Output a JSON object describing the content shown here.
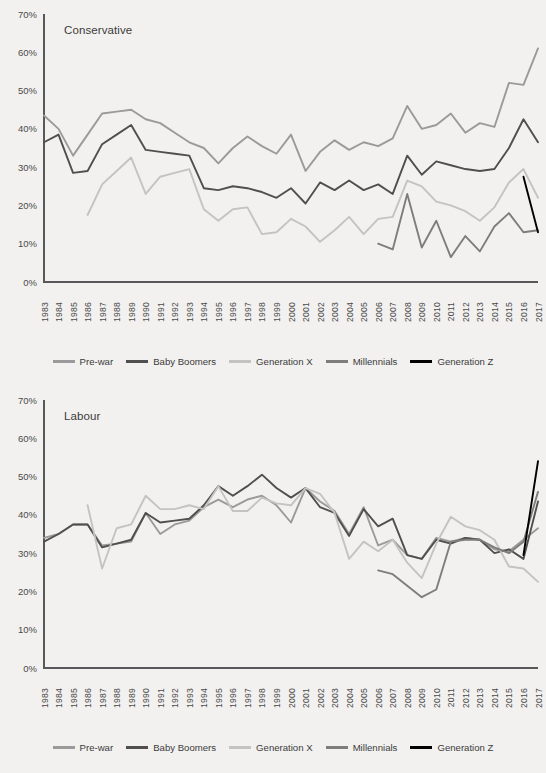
{
  "background_color": "#f2f1ef",
  "axis_color": "#58585a",
  "legend": {
    "items": [
      {
        "label": "Pre-war",
        "color": "#9a9a9a"
      },
      {
        "label": "Baby Boomers",
        "color": "#4f4f4f"
      },
      {
        "label": "Generation X",
        "color": "#c3c3c3"
      },
      {
        "label": "Millennials",
        "color": "#7d7d7d"
      },
      {
        "label": "Generation Z",
        "color": "#000000"
      }
    ]
  },
  "y_axis": {
    "ticks": [
      "0%",
      "10%",
      "20%",
      "30%",
      "40%",
      "50%",
      "60%",
      "70%"
    ],
    "min": 0,
    "max": 70
  },
  "x_axis": {
    "categories": [
      "1983",
      "1984",
      "1985",
      "1986",
      "1987",
      "1988",
      "1989",
      "1990",
      "1991",
      "1992",
      "1993",
      "1994",
      "1995",
      "1996",
      "1997",
      "1998",
      "1999",
      "2000",
      "2001",
      "2002",
      "2003",
      "2004",
      "2005",
      "2006",
      "2007",
      "2008",
      "2009",
      "2010",
      "2011",
      "2012",
      "2013",
      "2014",
      "2015",
      "2016",
      "2017"
    ]
  },
  "chart_data": [
    {
      "type": "line",
      "title": "Conservative",
      "xlabel": "",
      "ylabel": "",
      "ylim": [
        0,
        70
      ],
      "grid": false,
      "legend_position": "bottom",
      "x": [
        "1983",
        "1984",
        "1985",
        "1986",
        "1987",
        "1988",
        "1989",
        "1990",
        "1991",
        "1992",
        "1993",
        "1994",
        "1995",
        "1996",
        "1997",
        "1998",
        "1999",
        "2000",
        "2001",
        "2002",
        "2003",
        "2004",
        "2005",
        "2006",
        "2007",
        "2008",
        "2009",
        "2010",
        "2011",
        "2012",
        "2013",
        "2014",
        "2015",
        "2016",
        "2017"
      ],
      "series": [
        {
          "name": "Pre-war",
          "color": "#9a9a9a",
          "values": [
            43.5,
            40.0,
            33.0,
            38.5,
            44.0,
            44.5,
            45.0,
            42.5,
            41.5,
            39.0,
            36.5,
            35.0,
            31.0,
            35.0,
            38.0,
            35.5,
            33.5,
            38.5,
            29.0,
            34.0,
            37.0,
            34.5,
            36.5,
            35.5,
            37.5,
            46.0,
            40.0,
            41.0,
            44.0,
            39.0,
            41.5,
            40.5,
            52.0,
            51.5,
            61.0
          ]
        },
        {
          "name": "Baby Boomers",
          "color": "#4f4f4f",
          "values": [
            36.5,
            38.5,
            28.5,
            29.0,
            36.0,
            38.5,
            41.0,
            34.5,
            34.0,
            33.5,
            33.0,
            24.5,
            24.0,
            25.0,
            24.5,
            23.5,
            22.0,
            24.5,
            20.5,
            26.0,
            24.0,
            26.5,
            24.0,
            25.5,
            23.0,
            33.0,
            28.0,
            31.5,
            30.5,
            29.5,
            29.0,
            29.5,
            35.0,
            42.5,
            36.5
          ]
        },
        {
          "name": "Generation X",
          "color": "#c3c3c3",
          "values": [
            null,
            null,
            null,
            17.5,
            25.5,
            29.0,
            32.5,
            23.0,
            27.5,
            28.5,
            29.5,
            19.0,
            16.0,
            19.0,
            19.5,
            12.5,
            13.0,
            16.5,
            14.5,
            10.5,
            13.5,
            17.0,
            12.5,
            16.5,
            17.0,
            26.5,
            25.0,
            21.0,
            20.0,
            18.5,
            16.0,
            19.5,
            26.0,
            29.5,
            22.0
          ]
        },
        {
          "name": "Millennials",
          "color": "#7d7d7d",
          "values": [
            null,
            null,
            null,
            null,
            null,
            null,
            null,
            null,
            null,
            null,
            null,
            null,
            null,
            null,
            null,
            null,
            null,
            null,
            null,
            null,
            null,
            null,
            null,
            10.0,
            8.5,
            23.0,
            9.0,
            16.0,
            6.5,
            12.0,
            8.0,
            14.5,
            18.0,
            13.0,
            13.5
          ]
        },
        {
          "name": "Generation Z",
          "color": "#000000",
          "values": [
            null,
            null,
            null,
            null,
            null,
            null,
            null,
            null,
            null,
            null,
            null,
            null,
            null,
            null,
            null,
            null,
            null,
            null,
            null,
            null,
            null,
            null,
            null,
            null,
            null,
            null,
            null,
            null,
            null,
            null,
            null,
            null,
            null,
            27.5,
            13.0
          ]
        }
      ]
    },
    {
      "type": "line",
      "title": "Labour",
      "xlabel": "",
      "ylabel": "",
      "ylim": [
        0,
        70
      ],
      "grid": false,
      "legend_position": "bottom",
      "x": [
        "1983",
        "1984",
        "1985",
        "1986",
        "1987",
        "1988",
        "1989",
        "1990",
        "1991",
        "1992",
        "1993",
        "1994",
        "1995",
        "1996",
        "1997",
        "1998",
        "1999",
        "2000",
        "2001",
        "2002",
        "2003",
        "2004",
        "2005",
        "2006",
        "2007",
        "2008",
        "2009",
        "2010",
        "2011",
        "2012",
        "2013",
        "2014",
        "2015",
        "2016",
        "2017"
      ],
      "series": [
        {
          "name": "Pre-war",
          "color": "#9a9a9a",
          "values": [
            34.0,
            35.0,
            37.5,
            37.5,
            32.0,
            32.5,
            33.0,
            40.5,
            35.0,
            37.5,
            38.5,
            42.0,
            44.0,
            42.0,
            44.0,
            45.0,
            42.5,
            38.0,
            47.0,
            43.5,
            41.0,
            35.0,
            42.0,
            32.0,
            33.5,
            29.5,
            28.5,
            34.0,
            33.0,
            34.0,
            33.5,
            31.0,
            30.5,
            33.5,
            36.5
          ]
        },
        {
          "name": "Baby Boomers",
          "color": "#4f4f4f",
          "values": [
            33.0,
            35.0,
            37.5,
            37.5,
            31.5,
            32.5,
            33.5,
            40.5,
            38.0,
            38.5,
            39.0,
            42.5,
            47.5,
            45.0,
            47.5,
            50.5,
            47.0,
            44.5,
            47.0,
            42.0,
            40.5,
            34.5,
            41.5,
            37.0,
            39.0,
            29.5,
            28.5,
            33.5,
            32.5,
            34.0,
            33.5,
            30.0,
            31.0,
            28.5,
            43.5
          ]
        },
        {
          "name": "Generation X",
          "color": "#c3c3c3",
          "values": [
            null,
            null,
            null,
            42.5,
            26.0,
            36.5,
            37.5,
            45.0,
            41.5,
            41.5,
            42.5,
            41.5,
            47.5,
            41.0,
            41.0,
            44.5,
            43.0,
            42.5,
            47.0,
            45.5,
            40.5,
            28.5,
            33.0,
            30.5,
            33.5,
            27.5,
            23.5,
            32.5,
            39.5,
            37.0,
            36.0,
            33.5,
            26.5,
            26.0,
            22.5
          ]
        },
        {
          "name": "Millennials",
          "color": "#7d7d7d",
          "values": [
            null,
            null,
            null,
            null,
            null,
            null,
            null,
            null,
            null,
            null,
            null,
            null,
            null,
            null,
            null,
            null,
            null,
            null,
            null,
            null,
            null,
            null,
            null,
            25.5,
            24.5,
            21.5,
            18.5,
            20.5,
            33.0,
            33.5,
            33.5,
            31.5,
            30.0,
            33.0,
            46.0
          ]
        },
        {
          "name": "Generation Z",
          "color": "#000000",
          "values": [
            null,
            null,
            null,
            null,
            null,
            null,
            null,
            null,
            null,
            null,
            null,
            null,
            null,
            null,
            null,
            null,
            null,
            null,
            null,
            null,
            null,
            null,
            null,
            null,
            null,
            null,
            null,
            null,
            null,
            null,
            null,
            null,
            null,
            29.5,
            54.0
          ]
        }
      ]
    }
  ]
}
